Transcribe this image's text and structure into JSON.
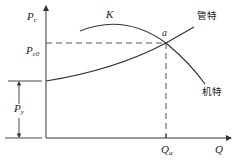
{
  "diagram": {
    "type": "pump-pipe characteristic curves",
    "axes": {
      "y_label_main": "P",
      "y_label_sub": "c",
      "x_label": "Q"
    },
    "labels": {
      "pc0_main": "P",
      "pc0_sub": "c0",
      "py_main": "P",
      "py_sub": "y",
      "qa_main": "Q",
      "qa_sub": "a",
      "k": "K",
      "a": "a",
      "pipe_curve": "管特",
      "pump_curve": "机特"
    },
    "curves": [
      {
        "name": "pipe-characteristic",
        "label": "管特",
        "shape": "rising, starts at P_y on vertical axis"
      },
      {
        "name": "pump-characteristic",
        "label": "机特",
        "shape": "falling, peak near K"
      }
    ],
    "operating_point": {
      "label": "a",
      "pressure": "P_c0",
      "flow": "Q_a"
    },
    "colors": {
      "line": "#333333",
      "dash": "#555555"
    }
  }
}
